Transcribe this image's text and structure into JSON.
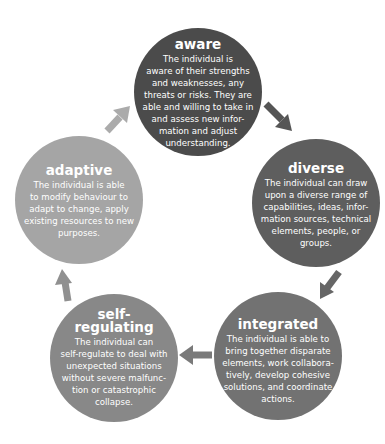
{
  "diagram": {
    "type": "cycle",
    "nodes": [
      {
        "id": "aware",
        "title": "aware",
        "description": "The individual is\naware of their strengths\nand weaknesses, any\nthreats or risks. They are\nable and willing to take in\nand assess new infor-\nmation and adjust\nunderstanding.",
        "color": "#4b4b4b"
      },
      {
        "id": "diverse",
        "title": "diverse",
        "description": "The individual can draw\nupon a diverse range of\ncapabilities, ideas, infor-\nmation sources, technical\nelements, people, or\ngroups.",
        "color": "#5e5e5e"
      },
      {
        "id": "integrated",
        "title": "integrated",
        "description": "The individual is able to\nbring together disparate\nelements, work collabora-\ntively, develop cohesive\nsolutions, and coordinate\nactions.",
        "color": "#727272"
      },
      {
        "id": "self-regulating",
        "title": "self-\nregulating",
        "description": "The individual can\nself-regulate to deal with\nunexpected situations\nwithout severe malfunc-\ntion or catastrophic\ncollapse.",
        "color": "#888888"
      },
      {
        "id": "adaptive",
        "title": "adaptive",
        "description": "The individual is able\nto modify behaviour to\nadapt to change, apply\nexisting resources to new\npurposes.",
        "color": "#a5a5a5"
      }
    ],
    "arrows": [
      {
        "from": "aware",
        "to": "diverse",
        "color": "#555555"
      },
      {
        "from": "diverse",
        "to": "integrated",
        "color": "#666666"
      },
      {
        "from": "integrated",
        "to": "self-regulating",
        "color": "#7a7a7a"
      },
      {
        "from": "self-regulating",
        "to": "adaptive",
        "color": "#909090"
      },
      {
        "from": "adaptive",
        "to": "aware",
        "color": "#ababab"
      }
    ]
  }
}
